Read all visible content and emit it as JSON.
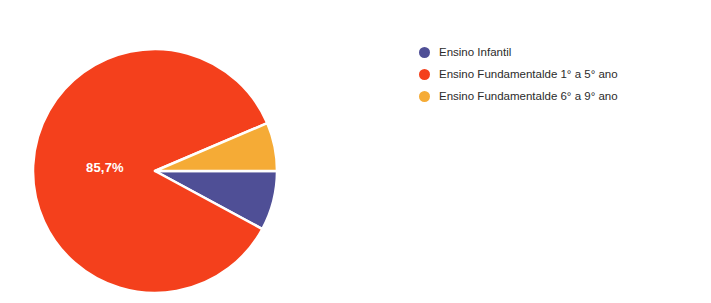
{
  "chart_data": {
    "type": "pie",
    "title": "",
    "legend_position": "right",
    "categories": [
      "Ensino Infantil",
      "Ensino Fundamentalde 1° a 5° ano",
      "Ensino Fundamentalde 6° a 9° ano"
    ],
    "values": [
      7.9,
      85.7,
      6.4
    ],
    "slices": [
      {
        "label": "Ensino Infantil",
        "value": 7.9,
        "color": "#4F4F96",
        "start_angle": 0,
        "end_angle": 28.4,
        "data_label": ""
      },
      {
        "label": "Ensino Fundamentalde 1° a 5° ano",
        "value": 85.7,
        "color": "#F4401C",
        "start_angle": 28.4,
        "end_angle": 336.9,
        "data_label": "85,7%"
      },
      {
        "label": "Ensino Fundamentalde 6° a 9° ano",
        "value": 6.4,
        "color": "#F5AB36",
        "start_angle": 336.9,
        "end_angle": 360,
        "data_label": ""
      }
    ],
    "visible_data_labels": [
      "85,7%"
    ],
    "background_color": "#FFFFFF",
    "slice_border_color": "#FFFFFF"
  },
  "pie": {
    "center_x": 155,
    "center_y": 171,
    "radius": 122,
    "label_main": "85,7%",
    "label_main_x": 86,
    "label_main_y": 172
  },
  "legend": {
    "items": [
      {
        "label": "Ensino Infantil",
        "color": "#4F4F96"
      },
      {
        "label": "Ensino Fundamentalde 1° a 5° ano",
        "color": "#F4401C"
      },
      {
        "label": "Ensino Fundamentalde 6° a 9° ano",
        "color": "#F5AB36"
      }
    ]
  }
}
